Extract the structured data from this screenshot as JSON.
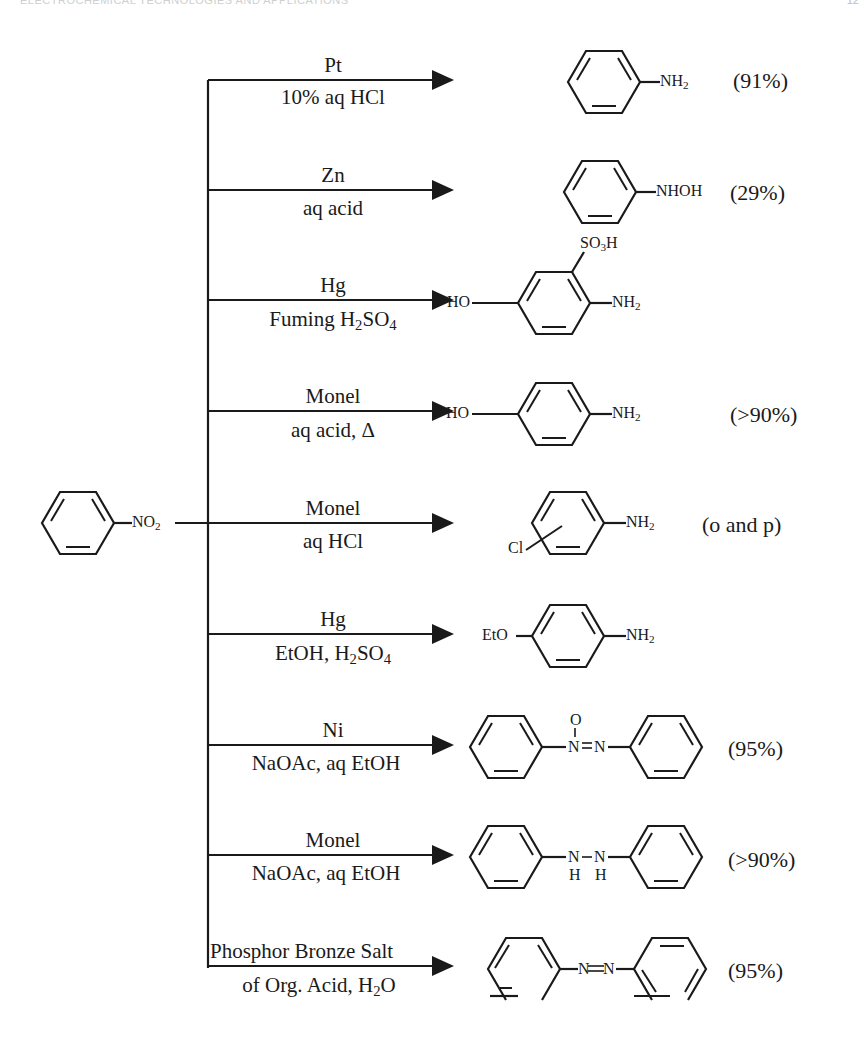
{
  "header": {
    "running_title": "ELECTROCHEMICAL TECHNOLOGIES AND APPLICATIONS",
    "page_number": "12"
  },
  "reactant": {
    "name": "nitrobenzene",
    "group_label": "NO2"
  },
  "reactions": [
    {
      "catalyst": "Pt",
      "conditions": "10% aq HCl",
      "product": "aniline",
      "product_label": "NH2",
      "yield": "(91%)"
    },
    {
      "catalyst": "Zn",
      "conditions": "aq acid",
      "product": "N-phenylhydroxylamine",
      "product_label": "NHOH",
      "yield": "(29%)"
    },
    {
      "catalyst": "Hg",
      "conditions": "Fuming H2SO4",
      "product": "5-hydroxy-2-aminobenzenesulfonic acid",
      "product_labels": [
        "HO",
        "NH2",
        "SO3H"
      ],
      "yield": ""
    },
    {
      "catalyst": "Monel",
      "conditions": "aq acid, Δ",
      "product": "p-aminophenol",
      "product_labels": [
        "HO",
        "NH2"
      ],
      "yield": "(>90%)"
    },
    {
      "catalyst": "Monel",
      "conditions": "aq HCl",
      "product": "chloroaniline",
      "product_labels": [
        "Cl",
        "NH2"
      ],
      "yield": "(o and p)"
    },
    {
      "catalyst": "Hg",
      "conditions": "EtOH, H2SO4",
      "product": "p-phenetidine",
      "product_labels": [
        "EtO",
        "NH2"
      ],
      "yield": ""
    },
    {
      "catalyst": "Ni",
      "conditions": "NaOAc, aq EtOH",
      "product": "azoxybenzene",
      "product_labels": [
        "O",
        "N",
        "N"
      ],
      "yield": "(95%)"
    },
    {
      "catalyst": "Monel",
      "conditions": "NaOAc, aq EtOH",
      "product": "hydrazobenzene",
      "product_labels": [
        "N",
        "N",
        "H",
        "H"
      ],
      "yield": "(>90%)"
    },
    {
      "catalyst": "Phosphor Bronze Salt",
      "conditions": "of Org. Acid, H2O",
      "product": "azobenzene",
      "product_labels": [
        "N",
        "N"
      ],
      "yield": "(95%)"
    }
  ]
}
